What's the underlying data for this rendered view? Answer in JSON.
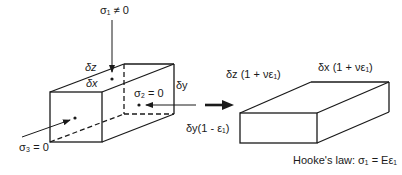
{
  "labels": {
    "sigma1": "σ₁ ≠ 0",
    "sigma2": "σ₂ = 0",
    "sigma3": "σ₃ = 0",
    "dz": "δz",
    "dx": "δx",
    "dy": "δy",
    "dz_deformed": "δz (1 + νε₁)",
    "dx_deformed": "δx (1 + νε₁)",
    "dy_deformed": "δy(1 - ε₁)",
    "hooke": "Hooke's law: σ₁ = Eε₁"
  },
  "colors": {
    "stroke": "#1a1a1a",
    "background": "#ffffff"
  }
}
